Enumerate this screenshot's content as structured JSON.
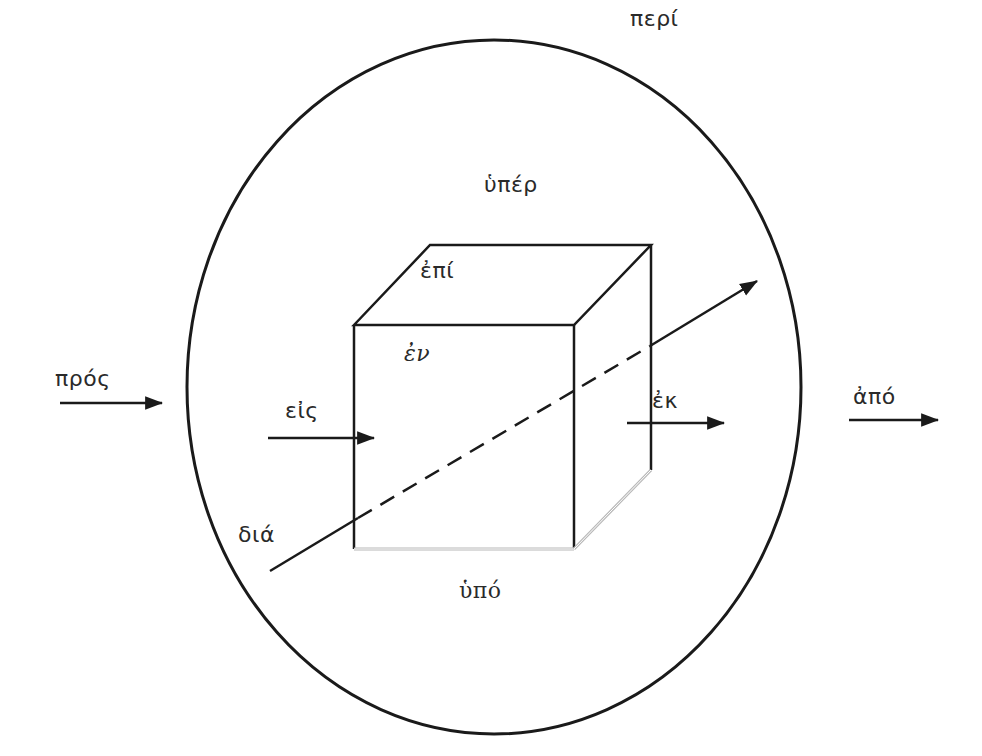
{
  "diagram": {
    "title": "",
    "colors": {
      "stroke": "#1a1a1a",
      "light_stroke": "#b8b8b8",
      "text": "#2a2a2a",
      "background": "#ffffff"
    },
    "labels": {
      "peri": "περί",
      "hyper": "ὑπέρ",
      "epi": "ἐπί",
      "en": "ἐν",
      "pros": "πρός",
      "eis": "εἰς",
      "ek": "ἐκ",
      "apo": "ἀπό",
      "dia": "διά",
      "hypo": "ὑπό"
    },
    "shapes": {
      "circle": {
        "cx": 494,
        "cy": 387,
        "rx": 307,
        "ry": 347
      },
      "cube_front": {
        "x1": 354,
        "y1": 325,
        "x2": 574,
        "y2": 549
      },
      "cube_back_top_left": {
        "x": 430,
        "y": 245
      },
      "cube_back_top_right": {
        "x": 651,
        "y": 245
      },
      "cube_back_bottom_right": {
        "x": 651,
        "y": 470
      }
    },
    "arrows": [
      {
        "name": "pros-arrow",
        "from": [
          60,
          403
        ],
        "to": [
          162,
          403
        ]
      },
      {
        "name": "eis-arrow",
        "from": [
          268,
          438
        ],
        "to": [
          374,
          438
        ]
      },
      {
        "name": "ek-arrow",
        "from": [
          627,
          423
        ],
        "to": [
          724,
          423
        ]
      },
      {
        "name": "apo-arrow",
        "from": [
          849,
          420
        ],
        "to": [
          938,
          420
        ]
      },
      {
        "name": "dia-arrow",
        "from": [
          270,
          571
        ],
        "to": [
          757,
          280
        ]
      }
    ]
  }
}
